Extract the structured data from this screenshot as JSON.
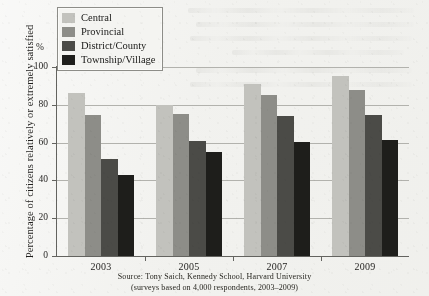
{
  "figure": {
    "y_axis_title": "Percentage of citizens relatively or extremely satisfied",
    "percent_symbol": "%",
    "source_line1": "Source: Tony Saich, Kennedy School, Harvard University",
    "source_line2": "(surveys based on 4,000 respondents, 2003–2009)"
  },
  "legend": {
    "items": [
      {
        "label": "Central",
        "color": "#c2c2bd"
      },
      {
        "label": "Provincial",
        "color": "#8d8d88"
      },
      {
        "label": "District/County",
        "color": "#4b4b47"
      },
      {
        "label": "Township/Village",
        "color": "#1e1e1b"
      }
    ]
  },
  "chart_data": {
    "type": "bar",
    "title": "",
    "xlabel": "",
    "ylabel": "Percentage of citizens relatively or extremely satisfied",
    "ylim": [
      0,
      100
    ],
    "yticks": [
      0,
      20,
      40,
      60,
      80,
      100
    ],
    "ytick_labels": [
      "0",
      "20",
      "40",
      "60",
      "80",
      "100"
    ],
    "grid": true,
    "legend_position": "top-left",
    "categories": [
      "2003",
      "2005",
      "2007",
      "2009"
    ],
    "series": [
      {
        "name": "Central",
        "color": "#c2c2bd",
        "values": [
          86,
          80,
          91,
          95.5
        ]
      },
      {
        "name": "Provincial",
        "color": "#8d8d88",
        "values": [
          74.5,
          75,
          85,
          88
        ]
      },
      {
        "name": "District/County",
        "color": "#4b4b47",
        "values": [
          51.5,
          61,
          74,
          74.5
        ]
      },
      {
        "name": "Township/Village",
        "color": "#1e1e1b",
        "values": [
          43,
          55,
          60.5,
          61.5
        ]
      }
    ]
  }
}
